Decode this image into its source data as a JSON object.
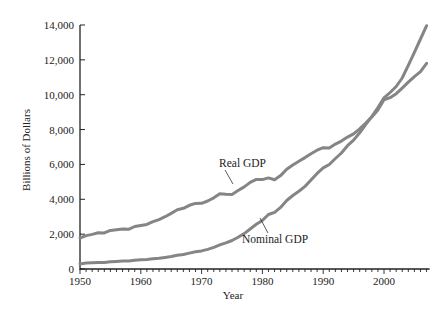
{
  "chart_data": {
    "type": "line",
    "title": "",
    "xlabel": "Year",
    "ylabel": "Billions of Dollars",
    "xlim": [
      1950,
      2007
    ],
    "ylim": [
      0,
      14000
    ],
    "grid": false,
    "legend": "none (inline annotations)",
    "x_ticks": [
      1950,
      1960,
      1970,
      1980,
      1990,
      2000
    ],
    "x_tick_labels": [
      "1950",
      "1960",
      "1970",
      "1980",
      "1990",
      "2000"
    ],
    "y_ticks": [
      0,
      2000,
      4000,
      6000,
      8000,
      10000,
      12000,
      14000
    ],
    "y_tick_labels": [
      "0",
      "2,000",
      "4,000",
      "6,000",
      "8,000",
      "10,000",
      "12,000",
      "14,000"
    ],
    "x": [
      1950,
      1951,
      1952,
      1953,
      1954,
      1955,
      1956,
      1957,
      1958,
      1959,
      1960,
      1961,
      1962,
      1963,
      1964,
      1965,
      1966,
      1967,
      1968,
      1969,
      1970,
      1971,
      1972,
      1973,
      1974,
      1975,
      1976,
      1977,
      1978,
      1979,
      1980,
      1981,
      1982,
      1983,
      1984,
      1985,
      1986,
      1987,
      1988,
      1989,
      1990,
      1991,
      1992,
      1993,
      1994,
      1995,
      1996,
      1997,
      1998,
      1999,
      2000,
      2001,
      2002,
      2003,
      2004,
      2005,
      2006,
      2007
    ],
    "series": [
      {
        "name": "Real GDP",
        "values": [
          1777,
          1915,
          1988,
          2080,
          2070,
          2212,
          2256,
          2301,
          2279,
          2441,
          2502,
          2560,
          2715,
          2834,
          2999,
          3191,
          3399,
          3485,
          3653,
          3765,
          3772,
          3899,
          4085,
          4312,
          4290,
          4283,
          4504,
          4709,
          4970,
          5139,
          5129,
          5229,
          5121,
          5359,
          5722,
          5967,
          6179,
          6389,
          6614,
          6816,
          6961,
          6942,
          7165,
          7338,
          7570,
          7754,
          8037,
          8376,
          8728,
          9131,
          9706,
          9830,
          10060,
          10380,
          10720,
          11040,
          11320,
          11800
        ]
      },
      {
        "name": "Nominal GDP",
        "values": [
          293,
          339,
          358,
          379,
          380,
          415,
          438,
          461,
          467,
          507,
          526,
          545,
          586,
          618,
          664,
          719,
          788,
          833,
          910,
          985,
          1039,
          1127,
          1238,
          1382,
          1500,
          1638,
          1825,
          2031,
          2295,
          2566,
          2790,
          3129,
          3255,
          3537,
          3933,
          4220,
          4463,
          4740,
          5104,
          5484,
          5803,
          5996,
          6338,
          6657,
          7072,
          7398,
          7817,
          8304,
          8747,
          9268,
          9817,
          10128,
          10470,
          10961,
          11686,
          12434,
          13195,
          13960
        ]
      }
    ],
    "annotations": [
      {
        "text": "Real GDP",
        "x": 1976,
        "y": 5800,
        "pointer_to": {
          "x": 1977,
          "y": 4600
        }
      },
      {
        "text": "Nominal GDP",
        "x": 1985,
        "y": 1800,
        "pointer_to": {
          "x": 1981,
          "y": 3150
        }
      }
    ]
  },
  "labels": {
    "ylabel": "Billions of Dollars",
    "xlabel": "Year",
    "real": "Real GDP",
    "nominal": "Nominal GDP"
  }
}
